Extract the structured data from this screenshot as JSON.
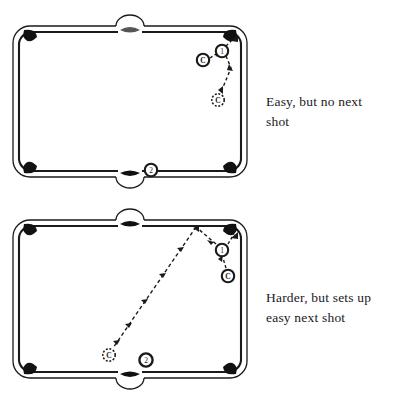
{
  "page": {
    "background": "#ffffff",
    "ink": "#1a1a18"
  },
  "diagrams": [
    {
      "id": "diagram-1",
      "name": "easy-shot-diagram",
      "caption_lines": [
        "Easy, but no next shot",
        ""
      ],
      "caption_line_1": "Easy, but no next",
      "caption_line_2": "shot",
      "table": {
        "rail_color": "#1a1a18",
        "cloth_color": "#ffffff",
        "pockets": 6
      },
      "balls": [
        {
          "name": "cue-ball",
          "label": "C",
          "style": "solid",
          "x": 203,
          "y": 60
        },
        {
          "name": "ball-1",
          "label": "1",
          "style": "solid",
          "x": 222,
          "y": 51
        },
        {
          "name": "cue-ball-future",
          "label": "C",
          "style": "dashed",
          "x": 218,
          "y": 100
        },
        {
          "name": "ball-2",
          "label": "2",
          "style": "solid",
          "x": 151,
          "y": 170
        }
      ],
      "paths": [
        {
          "name": "cue-to-object-path",
          "style": "dashed",
          "from": "cue-ball",
          "to": "ball-1"
        },
        {
          "name": "object-to-pocket-path",
          "style": "dashed",
          "from": "ball-1",
          "to": "corner-pocket-top-right"
        },
        {
          "name": "cue-rebound-path",
          "style": "dashed",
          "from": "ball-1",
          "to": "cue-ball-future"
        }
      ]
    },
    {
      "id": "diagram-2",
      "name": "harder-shot-diagram",
      "caption_lines": [
        "Harder, but sets up easy next shot",
        ""
      ],
      "caption_line_1": "Harder, but sets up",
      "caption_line_2": "easy next shot",
      "table": {
        "rail_color": "#1a1a18",
        "cloth_color": "#ffffff",
        "pockets": 6
      },
      "balls": [
        {
          "name": "cue-ball",
          "label": "C",
          "style": "solid",
          "x": 228,
          "y": 276
        },
        {
          "name": "ball-1",
          "label": "1",
          "style": "solid",
          "x": 222,
          "y": 250
        },
        {
          "name": "cue-ball-future",
          "label": "C",
          "style": "dashed",
          "x": 108,
          "y": 355
        },
        {
          "name": "ball-2",
          "label": "2",
          "style": "solid",
          "x": 146,
          "y": 360
        }
      ],
      "paths": [
        {
          "name": "cue-to-object-path",
          "style": "dashed",
          "from": "cue-ball",
          "to": "ball-1"
        },
        {
          "name": "object-to-pocket-path",
          "style": "dashed",
          "from": "ball-1",
          "to": "corner-pocket-top-right"
        },
        {
          "name": "cue-rail-path",
          "style": "dashed",
          "from": "ball-1",
          "to": "top-rail"
        },
        {
          "name": "cue-travel-path",
          "style": "dashed",
          "from": "top-rail",
          "to": "cue-ball-future"
        }
      ]
    }
  ]
}
